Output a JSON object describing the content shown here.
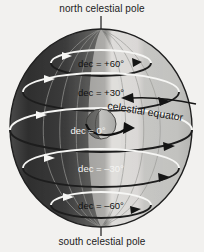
{
  "diagram": {
    "title_top": "north celestial pole",
    "title_bottom": "south celestial pole",
    "equator_label": "celestial equator",
    "background_color": "#f2f1ef",
    "text_color": "#1b1b1b",
    "sphere": {
      "center_x": 101,
      "center_y": 128,
      "radius_x": 91,
      "radius_y": 99,
      "dark_side_color": "#3a3a3a",
      "light_side_color": "#c9c9c7",
      "highlight_band_color": "#dddddb",
      "meridian_line_color": "#9a9a98"
    },
    "earth": {
      "label": "earth",
      "center_x": 101,
      "center_y": 124,
      "radius": 15,
      "lit_color": "#b9b9b6",
      "shadow_color": "#6a6a68",
      "rotation_arrow": "counterclockwise"
    },
    "declination_rings": [
      {
        "label": "dec  =  +60°",
        "value": 60,
        "y": 63,
        "rx": 50,
        "ry": 13,
        "line_color": "#f4f4f2",
        "arrow_color": "#262626",
        "label_x": 101,
        "label_y": 64
      },
      {
        "label": "dec  =  +30°",
        "value": 30,
        "y": 92,
        "rx": 78,
        "ry": 19,
        "line_color": "#f4f4f2",
        "arrow_color": "#262626",
        "label_x": 101,
        "label_y": 93
      },
      {
        "label": "dec  =  0°",
        "value": 0,
        "y": 130,
        "rx": 91,
        "ry": 22,
        "line_color": "#f4f4f2",
        "arrow_color": "#262626",
        "label_x": 101,
        "label_y": 131
      },
      {
        "label": "dec  =  –30°",
        "value": -30,
        "y": 168,
        "rx": 78,
        "ry": 19,
        "line_color": "#f4f4f2",
        "arrow_color": "#262626",
        "label_x": 101,
        "label_y": 169
      },
      {
        "label": "dec  =  –60°",
        "value": -60,
        "y": 205,
        "rx": 50,
        "ry": 13,
        "line_color": "#f4f4f2",
        "arrow_color": "#262626",
        "label_x": 101,
        "label_y": 206
      }
    ],
    "pole_axis": {
      "top_line": {
        "x": 101,
        "y1": 16,
        "y2": 32
      },
      "bottom_line": {
        "x": 101,
        "y1": 222,
        "y2": 236
      },
      "color": "#2b2b2b"
    }
  }
}
